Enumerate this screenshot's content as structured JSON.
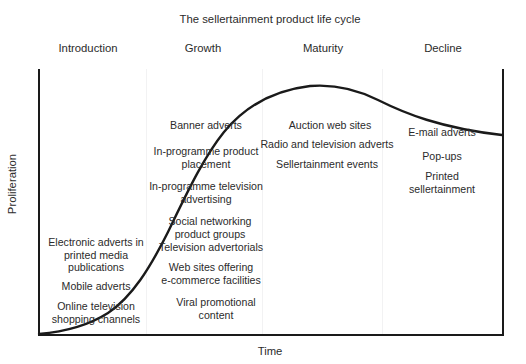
{
  "chart_data": {
    "type": "line",
    "title": "The sellertainment product life cycle",
    "xlabel": "Time",
    "ylabel": "Proliferation",
    "grid": false,
    "legend": "none",
    "x_axis_ticks": [],
    "y_axis_ticks": [],
    "stages": [
      {
        "name": "Introduction",
        "center_x": 88,
        "items": [
          "Electronic adverts in\nprinted media\npublications",
          "Mobile adverts",
          "Online television\nshopping channels"
        ]
      },
      {
        "name": "Growth",
        "center_x": 203,
        "items": [
          "Banner adverts",
          "In-programme product\nplacement",
          "In-programme television\nadvertising",
          "Social networking\nproduct groups",
          "Television advertorials",
          "Web sites offering\ne-commerce facilities",
          "Viral promotional\ncontent"
        ]
      },
      {
        "name": "Maturity",
        "center_x": 323,
        "items": [
          "Auction web sites",
          "Radio and television adverts",
          "Sellertainment events"
        ]
      },
      {
        "name": "Decline",
        "center_x": 443,
        "items": [
          "E-mail adverts",
          "Pop-ups",
          "Printed sellertainment"
        ]
      }
    ],
    "curve_description": "S-shaped product life cycle curve rising slowly through Introduction, steeply through Growth, peaking in Maturity, then declining",
    "curve_points": [
      {
        "x": 0,
        "y": 0
      },
      {
        "x": 0.1,
        "y": 0.02
      },
      {
        "x": 0.2,
        "y": 0.06
      },
      {
        "x": 0.3,
        "y": 0.17
      },
      {
        "x": 0.4,
        "y": 0.38
      },
      {
        "x": 0.5,
        "y": 0.63
      },
      {
        "x": 0.6,
        "y": 0.84
      },
      {
        "x": 0.7,
        "y": 0.95
      },
      {
        "x": 0.78,
        "y": 0.98
      },
      {
        "x": 0.85,
        "y": 0.95
      },
      {
        "x": 0.92,
        "y": 0.88
      },
      {
        "x": 1.0,
        "y": 0.76
      }
    ],
    "stage_divider_x": [
      146,
      262,
      382
    ],
    "colors": {
      "curve": "#1a1a1a",
      "axis": "#1a1a1a",
      "text": "#2b2b2b",
      "divider": "#f2f2f3",
      "background": "#ffffff"
    }
  },
  "annotations": {
    "introduction": [
      {
        "text": "Electronic adverts in\nprinted media\npublications",
        "x": 96,
        "y": 236
      },
      {
        "text": "Mobile adverts",
        "x": 96,
        "y": 280
      },
      {
        "text": "Online television\nshopping channels",
        "x": 96,
        "y": 300
      }
    ],
    "growth": [
      {
        "text": "Banner adverts",
        "x": 206,
        "y": 119
      },
      {
        "text": "In-programme product\nplacement",
        "x": 206,
        "y": 145
      },
      {
        "text": "In-programme television\nadvertising",
        "x": 206,
        "y": 180
      },
      {
        "text": "Social networking\nproduct groups",
        "x": 210,
        "y": 215
      },
      {
        "text": "Television advertorials",
        "x": 211,
        "y": 241
      },
      {
        "text": "Web sites offering\ne-commerce facilities",
        "x": 211,
        "y": 261
      },
      {
        "text": "Viral promotional\ncontent",
        "x": 216,
        "y": 296
      }
    ],
    "maturity": [
      {
        "text": "Auction web sites",
        "x": 330,
        "y": 119
      },
      {
        "text": "Radio and television adverts",
        "x": 327,
        "y": 138
      },
      {
        "text": "Sellertainment events",
        "x": 327,
        "y": 158
      }
    ],
    "decline": [
      {
        "text": "E-mail adverts",
        "x": 442,
        "y": 126
      },
      {
        "text": "Pop-ups",
        "x": 442,
        "y": 150
      },
      {
        "text": "Printed sellertainment",
        "x": 442,
        "y": 170
      }
    ]
  }
}
